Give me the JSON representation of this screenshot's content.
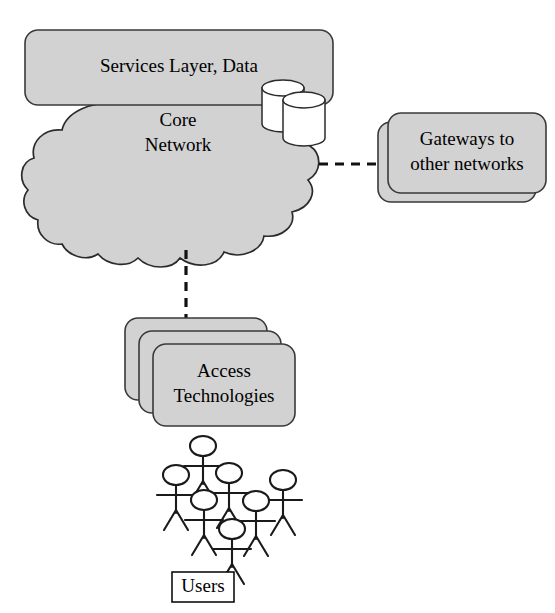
{
  "diagram": {
    "background_color": "#ffffff",
    "shape_fill_color": "#d2d2d2",
    "shape_stroke_color": "#3a3a3a",
    "cylinder_fill_color": "#ffffff",
    "link_color": "#111111",
    "nodes": {
      "services": {
        "label": "Services Layer, Data",
        "shape": "rounded-rectangle",
        "stack_count": 1
      },
      "core": {
        "label_line1": "Core",
        "label_line2": "Network",
        "shape": "cloud"
      },
      "gateways": {
        "label_line1": "Gateways to",
        "label_line2": "other networks",
        "shape": "rounded-rectangle",
        "stack_count": 2
      },
      "access": {
        "label_line1": "Access",
        "label_line2": "Technologies",
        "shape": "rounded-rectangle",
        "stack_count": 3
      },
      "users": {
        "label": "Users",
        "shape": "rectangle",
        "figure_count": 7
      },
      "databases": {
        "count": 2,
        "shape": "cylinder"
      }
    },
    "links": [
      {
        "from": "core",
        "to": "gateways",
        "style": "dashed",
        "orientation": "horizontal"
      },
      {
        "from": "core",
        "to": "access",
        "style": "dashed",
        "orientation": "vertical"
      }
    ]
  }
}
